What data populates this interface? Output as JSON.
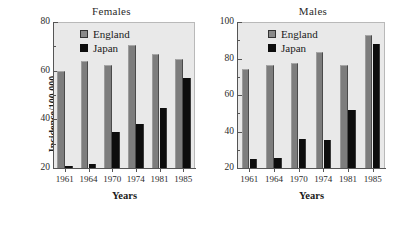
{
  "figure": {
    "ylabel": "Incidence/100 000",
    "xlabel_left": "Years",
    "xlabel_right": "Years",
    "legend_england": "England",
    "legend_japan": "Japan",
    "color_england": "#7d7d7d",
    "color_japan": "#0d0d0d",
    "color_plot_background": "#e9e9e9"
  },
  "chart_data": [
    {
      "type": "bar",
      "title": "Females",
      "xlabel": "Years",
      "ylabel": "Incidence/100 000",
      "categories": [
        "1961",
        "1964",
        "1970",
        "1974",
        "1981",
        "1985"
      ],
      "series": [
        {
          "name": "England",
          "color": "#7d7d7d",
          "values": [
            60,
            64,
            62.5,
            70.5,
            67,
            65
          ]
        },
        {
          "name": "Japan",
          "color": "#0d0d0d",
          "values": [
            21,
            21.5,
            35,
            38,
            44.5,
            57
          ]
        }
      ],
      "ylim": [
        20,
        80
      ],
      "yticks": [
        20,
        40,
        60,
        80
      ],
      "ytick_labels": [
        "20",
        "40",
        "60",
        "80"
      ],
      "yminorticks": [
        30,
        50,
        70
      ],
      "grid": false,
      "legend_position": "top-left"
    },
    {
      "type": "bar",
      "title": "Males",
      "xlabel": "Years",
      "ylabel": "Incidence/100 000",
      "categories": [
        "1961",
        "1964",
        "1970",
        "1974",
        "1981",
        "1985"
      ],
      "series": [
        {
          "name": "England",
          "color": "#7d7d7d",
          "values": [
            74.5,
            76.5,
            77.5,
            83.5,
            76.5,
            93
          ]
        },
        {
          "name": "Japan",
          "color": "#0d0d0d",
          "values": [
            25,
            25.5,
            36,
            35.5,
            52,
            88
          ]
        }
      ],
      "ylim": [
        20,
        100
      ],
      "yticks": [
        20,
        40,
        60,
        80,
        100
      ],
      "ytick_labels": [
        "20",
        "40",
        "60",
        "80",
        "100"
      ],
      "yminorticks": [
        30,
        50,
        70,
        90
      ],
      "grid": false,
      "legend_position": "top-left"
    }
  ]
}
